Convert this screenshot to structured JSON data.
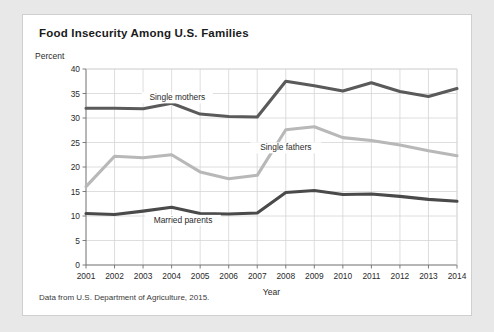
{
  "card": {
    "title": "Food Insecurity Among U.S. Families",
    "source_note": "Data from U.S. Department of Agriculture, 2015.",
    "percent_label": "Percent"
  },
  "chart_data": {
    "type": "line",
    "title": "Food Insecurity Among U.S. Families",
    "xlabel": "Year",
    "ylabel": "Percent",
    "categories": [
      "2001",
      "2002",
      "2003",
      "2004",
      "2005",
      "2006",
      "2007",
      "2008",
      "2009",
      "2010",
      "2011",
      "2012",
      "2013",
      "2014"
    ],
    "x": [
      2001,
      2002,
      2003,
      2004,
      2005,
      2006,
      2007,
      2008,
      2009,
      2010,
      2011,
      2012,
      2013,
      2014
    ],
    "xlim": [
      2001,
      2014
    ],
    "ylim": [
      0,
      40
    ],
    "yticks": [
      0,
      5,
      10,
      15,
      20,
      25,
      30,
      35,
      40
    ],
    "grid": true,
    "legend": "inline-labels",
    "series": [
      {
        "name": "Single mothers",
        "color": "#5a5a5a",
        "values": [
          32.0,
          32.0,
          31.9,
          33.0,
          30.8,
          30.3,
          30.2,
          37.5,
          36.6,
          35.5,
          37.2,
          35.4,
          34.4,
          36.0
        ],
        "label_x": 2004.2,
        "label_y": 33.6
      },
      {
        "name": "Single fathers",
        "color": "#b8b8b8",
        "values": [
          16.0,
          22.2,
          21.9,
          22.5,
          19.0,
          17.6,
          18.3,
          27.6,
          28.2,
          26.0,
          25.4,
          24.5,
          23.3,
          22.3
        ],
        "label_x": 2008.0,
        "label_y": 23.4
      },
      {
        "name": "Married parents",
        "color": "#4a4a4a",
        "values": [
          10.5,
          10.3,
          11.0,
          11.8,
          10.5,
          10.4,
          10.6,
          14.8,
          15.2,
          14.4,
          14.5,
          14.0,
          13.4,
          13.0
        ],
        "label_x": 2004.4,
        "label_y": 8.6
      }
    ]
  }
}
